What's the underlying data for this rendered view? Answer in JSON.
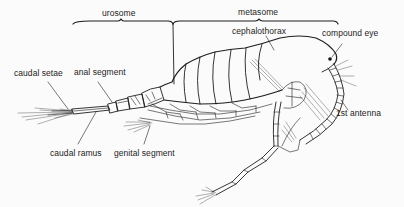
{
  "figure": {
    "background": "#fbfbfb",
    "ink_color": "#1e1e1e"
  },
  "regions": [
    {
      "id": "urosome",
      "label": "urosome"
    },
    {
      "id": "metasome",
      "label": "metasome"
    }
  ],
  "labels": [
    {
      "id": "cephalothorax",
      "text": "cephalothorax"
    },
    {
      "id": "compound-eye",
      "text": "compound eye"
    },
    {
      "id": "caudal-setae",
      "text": "caudal setae"
    },
    {
      "id": "anal-segment",
      "text": "anal segment"
    },
    {
      "id": "first-antenna",
      "text": "1st antenna"
    },
    {
      "id": "caudal-ramus",
      "text": "caudal ramus"
    },
    {
      "id": "genital-segment",
      "text": "genital segment"
    }
  ]
}
